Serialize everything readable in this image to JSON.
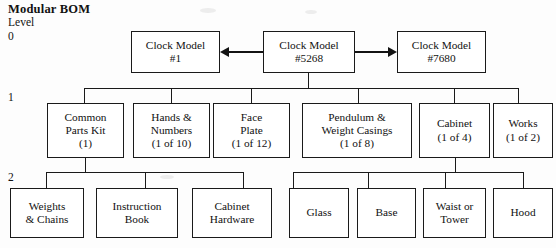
{
  "title": "Modular BOM",
  "levels": {
    "header": "Level",
    "zero": "0",
    "one": "1",
    "two": "2"
  },
  "level0": [
    {
      "line1": "Clock Model",
      "line2": "#1",
      "line3": ""
    },
    {
      "line1": "Clock Model",
      "line2": "#5268",
      "line3": ""
    },
    {
      "line1": "Clock Model",
      "line2": "#7680",
      "line3": ""
    }
  ],
  "level1": [
    {
      "line1": "Common",
      "line2": "Parts Kit",
      "line3": "(1)"
    },
    {
      "line1": "Hands &",
      "line2": "Numbers",
      "line3": "(1 of 10)"
    },
    {
      "line1": "Face",
      "line2": "Plate",
      "line3": "(1 of 12)"
    },
    {
      "line1": "Pendulum &",
      "line2": "Weight Casings",
      "line3": "(1 of 8)"
    },
    {
      "line1": "Cabinet",
      "line2": "(1 of 4)",
      "line3": ""
    },
    {
      "line1": "Works",
      "line2": "(1 of 2)",
      "line3": ""
    }
  ],
  "level2_left": [
    {
      "line1": "Weights",
      "line2": "& Chains",
      "line3": ""
    },
    {
      "line1": "Instruction",
      "line2": "Book",
      "line3": ""
    },
    {
      "line1": "Cabinet",
      "line2": "Hardware",
      "line3": ""
    }
  ],
  "level2_right": [
    {
      "line1": "Glass",
      "line2": "",
      "line3": ""
    },
    {
      "line1": "Base",
      "line2": "",
      "line3": ""
    },
    {
      "line1": "Waist or",
      "line2": "Tower",
      "line3": ""
    },
    {
      "line1": "Hood",
      "line2": "",
      "line3": ""
    }
  ],
  "colors": {
    "line": "#1a1a1a",
    "text": "#111111",
    "background": "#fdfdfd"
  }
}
